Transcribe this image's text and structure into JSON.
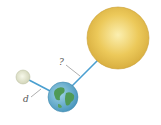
{
  "diagram": {
    "title": "",
    "bodies": [
      {
        "name": "Sun",
        "color": "#e8c556"
      },
      {
        "name": "Earth",
        "color": "#5fa8c8"
      },
      {
        "name": "Moon",
        "color": "#e6e8cf"
      }
    ],
    "labels": {
      "earth_sun_distance": "?",
      "earth_moon_distance": "d"
    },
    "line_color": "#4a9fd0"
  }
}
